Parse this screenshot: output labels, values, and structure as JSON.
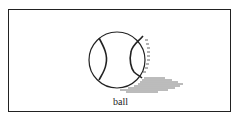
{
  "figure": {
    "caption": "ball",
    "colors": {
      "stroke": "#222222",
      "shadow": "#6a6a6a",
      "border": "#222222"
    }
  }
}
